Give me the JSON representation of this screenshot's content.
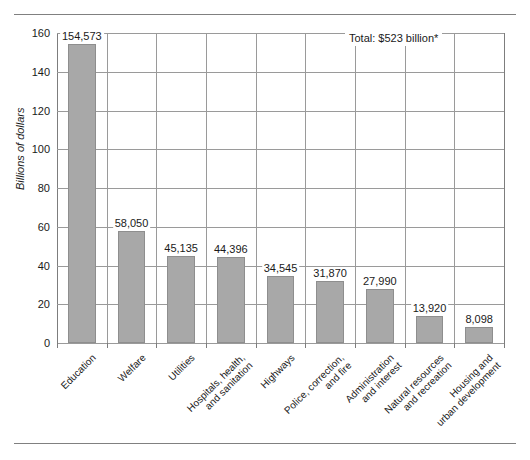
{
  "chart_data": {
    "type": "bar",
    "title": "",
    "subtitle": "",
    "xlabel": "",
    "ylabel": "Billions of dollars",
    "ylim": [
      0,
      160
    ],
    "ytick_labels": [
      "0",
      "20",
      "40",
      "60",
      "80",
      "100",
      "120",
      "140",
      "160"
    ],
    "ytick_values": [
      0,
      20,
      40,
      60,
      80,
      100,
      120,
      140,
      160
    ],
    "grid": "horizontal-and-vertical",
    "legend_position": "none",
    "annotation": "Total: $523 billion*",
    "bar_color": "#a8a8a8",
    "categories": [
      "Education",
      "Welfare",
      "Utilities",
      "Hospitals, health,\nand sanitation",
      "Highways",
      "Police, correction,\nand fire",
      "Administration\nand interest",
      "Natural resources\nand recreation",
      "Housing and\nurban development"
    ],
    "values": [
      154.573,
      58.05,
      45.135,
      44.396,
      34.545,
      31.87,
      27.99,
      13.92,
      8.098
    ],
    "value_labels": [
      "154,573",
      "58,050",
      "45,135",
      "44,396",
      "34,545",
      "31,870",
      "27,990",
      "13,920",
      "8,098"
    ]
  }
}
